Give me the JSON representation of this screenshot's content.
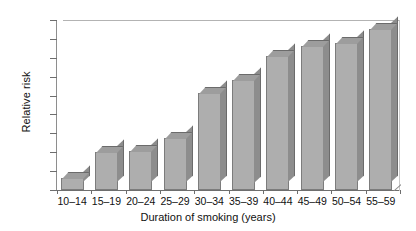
{
  "chart_data": {
    "type": "bar",
    "title": "",
    "xlabel": "Duration of smoking (years)",
    "ylabel": "Relative risk",
    "categories": [
      "10–14",
      "15–19",
      "20–24",
      "25–29",
      "30–34",
      "35–39",
      "40–44",
      "45–49",
      "50–54",
      "55–59"
    ],
    "values": [
      1.3,
      4.0,
      4.1,
      5.5,
      10.3,
      11.7,
      14.2,
      15.2,
      15.6,
      17.0
    ],
    "ylim": [
      0,
      18
    ],
    "ytick_values": [
      0,
      2,
      4,
      6,
      8,
      10,
      12,
      14,
      16,
      18
    ],
    "ytick_labels": [
      "0",
      "2",
      "4",
      "6",
      "8",
      "10",
      "12",
      "14",
      "16",
      "18"
    ],
    "grid": false,
    "legend": "none",
    "style": "pseudo-3d-bars",
    "colors": {
      "bar_front": "#aeaeae",
      "bar_side": "#8d8d8d",
      "bar_top": "#9d9d9d",
      "bar_outline": "#7c7c7c",
      "axis": "#6e6e6e",
      "frame": "#b3b3b3",
      "text": "#111111",
      "background": "#ffffff"
    }
  }
}
